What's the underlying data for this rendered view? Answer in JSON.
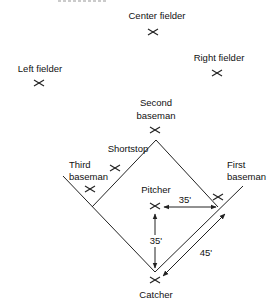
{
  "diagram": {
    "type": "baseball-field-positions",
    "positions": [
      {
        "id": "center-fielder",
        "label": "Center fielder"
      },
      {
        "id": "right-fielder",
        "label": "Right fielder"
      },
      {
        "id": "left-fielder",
        "label": "Left fielder"
      },
      {
        "id": "second-baseman",
        "label_line1": "Second",
        "label_line2": "baseman"
      },
      {
        "id": "shortstop",
        "label": "Shortstop"
      },
      {
        "id": "third-baseman",
        "label_line1": "Third",
        "label_line2": "baseman"
      },
      {
        "id": "first-baseman",
        "label_line1": "First",
        "label_line2": "baseman"
      },
      {
        "id": "pitcher",
        "label": "Pitcher"
      },
      {
        "id": "catcher",
        "label": "Catcher"
      }
    ],
    "dimensions": {
      "pitcher_to_first_line": "35'",
      "pitcher_to_home": "35'",
      "home_to_first": "45'"
    },
    "marker_glyph": "x-mark",
    "line_color": "#222222"
  }
}
